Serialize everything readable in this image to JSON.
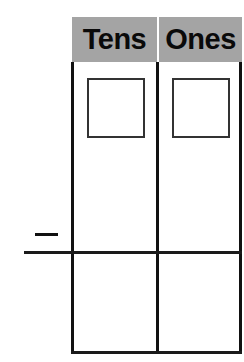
{
  "chart": {
    "columns": [
      {
        "label": "Tens"
      },
      {
        "label": "Ones"
      }
    ],
    "operator": {
      "symbol": "minus",
      "glyph": "−"
    },
    "rows": [
      {
        "name": "top-row",
        "cells": [
          "digit-box",
          "digit-box"
        ]
      },
      {
        "name": "answer-row",
        "cells": [
          "empty",
          "empty"
        ]
      }
    ]
  },
  "colors": {
    "header_bg": "#a4a4a4",
    "line": "#111111",
    "box_border": "#333333"
  }
}
